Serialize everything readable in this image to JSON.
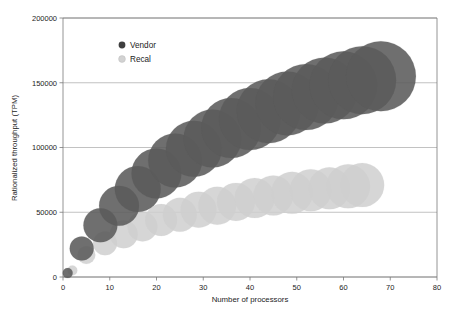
{
  "chart_data": {
    "type": "scatter",
    "variant": "bubble",
    "title": "",
    "xlabel": "Number of processors",
    "ylabel": "Rationalized throughput (TPM)",
    "xlim": [
      0,
      80
    ],
    "ylim": [
      0,
      200000
    ],
    "xticks": [
      0,
      10,
      20,
      30,
      40,
      50,
      60,
      70,
      80
    ],
    "yticks": [
      0,
      50000,
      100000,
      150000,
      200000
    ],
    "xtick_labels": [
      "0",
      "10",
      "20",
      "30",
      "40",
      "50",
      "60",
      "70",
      "80"
    ],
    "ytick_labels": [
      "0",
      "50000",
      "100000",
      "150000",
      "200000"
    ],
    "grid": "horizontal",
    "legend_position": "upper-left-inside",
    "background": "#ffffff",
    "series": [
      {
        "name": "Vendor",
        "color": "#5b5b5b",
        "opacity": 0.88,
        "points": [
          {
            "x": 1,
            "y": 3000,
            "size": 5
          },
          {
            "x": 4,
            "y": 22000,
            "size": 12
          },
          {
            "x": 8,
            "y": 40000,
            "size": 17
          },
          {
            "x": 12,
            "y": 55000,
            "size": 20
          },
          {
            "x": 16,
            "y": 68000,
            "size": 23
          },
          {
            "x": 20,
            "y": 80000,
            "size": 25
          },
          {
            "x": 24,
            "y": 90000,
            "size": 27
          },
          {
            "x": 28,
            "y": 99000,
            "size": 28
          },
          {
            "x": 32,
            "y": 107000,
            "size": 29
          },
          {
            "x": 36,
            "y": 115000,
            "size": 30
          },
          {
            "x": 40,
            "y": 122000,
            "size": 31
          },
          {
            "x": 44,
            "y": 128000,
            "size": 32
          },
          {
            "x": 48,
            "y": 134000,
            "size": 32
          },
          {
            "x": 52,
            "y": 139000,
            "size": 33
          },
          {
            "x": 56,
            "y": 144000,
            "size": 33
          },
          {
            "x": 60,
            "y": 148000,
            "size": 34
          },
          {
            "x": 64,
            "y": 152000,
            "size": 34
          },
          {
            "x": 68,
            "y": 155000,
            "size": 35
          }
        ]
      },
      {
        "name": "Recal",
        "color": "#cfcfcf",
        "opacity": 0.85,
        "points": [
          {
            "x": 2,
            "y": 5000,
            "size": 5
          },
          {
            "x": 5,
            "y": 17000,
            "size": 9
          },
          {
            "x": 9,
            "y": 26000,
            "size": 12
          },
          {
            "x": 13,
            "y": 33000,
            "size": 14
          },
          {
            "x": 17,
            "y": 39000,
            "size": 15
          },
          {
            "x": 21,
            "y": 44000,
            "size": 16
          },
          {
            "x": 25,
            "y": 48000,
            "size": 17
          },
          {
            "x": 29,
            "y": 52000,
            "size": 18
          },
          {
            "x": 33,
            "y": 55000,
            "size": 19
          },
          {
            "x": 37,
            "y": 58000,
            "size": 19
          },
          {
            "x": 41,
            "y": 61000,
            "size": 20
          },
          {
            "x": 45,
            "y": 63000,
            "size": 20
          },
          {
            "x": 49,
            "y": 65000,
            "size": 21
          },
          {
            "x": 53,
            "y": 67000,
            "size": 21
          },
          {
            "x": 57,
            "y": 68500,
            "size": 21
          },
          {
            "x": 61,
            "y": 70000,
            "size": 22
          },
          {
            "x": 64,
            "y": 71000,
            "size": 22
          }
        ]
      }
    ]
  },
  "legend": {
    "items": [
      {
        "label": "Vendor",
        "color": "#3f3f3f"
      },
      {
        "label": "Recal",
        "color": "#d2d2d2"
      }
    ]
  }
}
